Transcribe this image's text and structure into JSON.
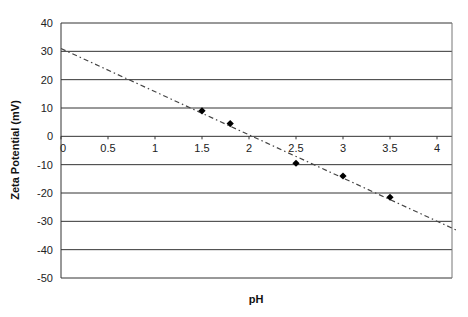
{
  "chart_data": {
    "type": "scatter",
    "title": "",
    "xlabel": "pH",
    "ylabel": "Zeta Potential (mV)",
    "xlim": [
      0,
      4.2
    ],
    "ylim": [
      -50,
      40
    ],
    "x_ticks": [
      "0",
      "0.5",
      "1",
      "1.5",
      "2",
      "2.5",
      "3",
      "3.5",
      "4"
    ],
    "y_ticks": [
      "40",
      "30",
      "20",
      "10",
      "0",
      "-10",
      "-20",
      "-30",
      "-40",
      "-50"
    ],
    "grid": "horizontal",
    "legend": "none",
    "series": [
      {
        "name": "Zeta Potential",
        "marker": "diamond",
        "points": [
          {
            "x": 1.5,
            "y": 9
          },
          {
            "x": 1.8,
            "y": 4.5
          },
          {
            "x": 2.5,
            "y": -9.5
          },
          {
            "x": 3.0,
            "y": -14
          },
          {
            "x": 3.5,
            "y": -21.5
          }
        ]
      }
    ],
    "trendline": {
      "style": "dash-dot",
      "from": {
        "x": 0,
        "y": 31
      },
      "to": {
        "x": 4.2,
        "y": -33
      }
    }
  },
  "colors": {
    "grid": "#333333",
    "marker": "#000000",
    "trendline": "#444444",
    "frame": "#777777"
  }
}
